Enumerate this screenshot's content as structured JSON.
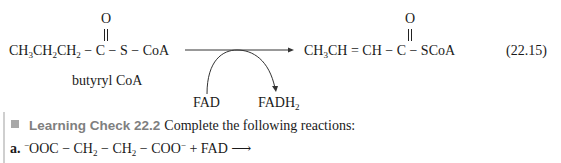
{
  "equation": {
    "reactant": {
      "carbonyl_o": "O",
      "left": "CH",
      "sub3": "3",
      "ch2a": "CH",
      "sub2a": "2",
      "ch2b": "CH",
      "sub2b": "2",
      "rest": " − C − S − CoA",
      "name": "butyryl CoA"
    },
    "product": {
      "carbonyl_o": "O",
      "ch3": "CH",
      "sub3": "3",
      "rest": "CH = CH − C − SCoA"
    },
    "coenzyme_in": "FAD",
    "coenzyme_out": "FADH",
    "coenzyme_out_sub": "2",
    "number": "(22.15)"
  },
  "learning_check": {
    "title": "Learning Check 22.2",
    "instruction": "Complete the following reactions:",
    "items": [
      {
        "label": "a.",
        "charge1": "−",
        "part1": "OOC − CH",
        "sub1": "2",
        "part2": " − CH",
        "sub2": "2",
        "part3": " − COO",
        "charge2": "−",
        "part4": " + FAD ⟶"
      }
    ]
  }
}
